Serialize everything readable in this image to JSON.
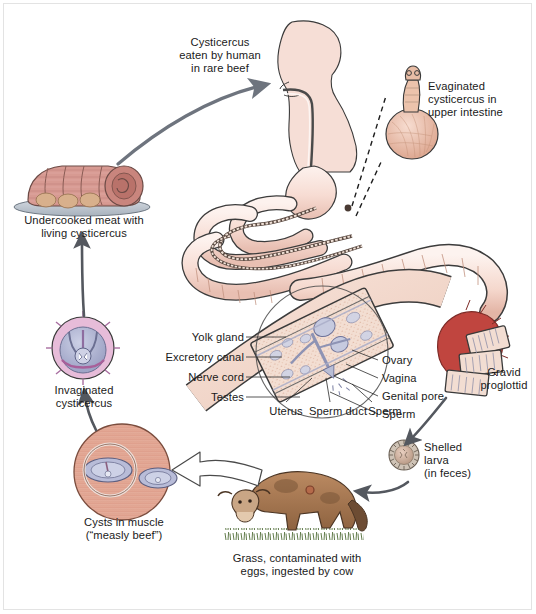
{
  "figure": {
    "background": "#ffffff",
    "border_color": "#e3e3e3"
  },
  "palette": {
    "flesh": "#f6ddd5",
    "flesh_dark": "#e9bfb2",
    "meat_pink": "#d79a92",
    "cyst_purple": "#b9bbd8",
    "cyst_pink": "#e7bcd9",
    "scolex_red": "#c0453f",
    "cow_brown": "#a97a55",
    "grass_green": "#4e6b34",
    "arrow_gray": "#6e747e",
    "arrow_dark": "#54585f",
    "leader_line": "#2b2b2b",
    "text": "#1a1a1a"
  },
  "labels": {
    "eaten_by_human": "Cysticercus\neaten by human\nin rare beef",
    "evaginated": "Evaginated\ncysticercus in\nupper intestine",
    "undercooked_meat": "Undercooked meat with\nliving cysticercus",
    "invaginated": "Invaginated\ncysticercus",
    "gravid_proglottid": "Gravid\nproglottid",
    "shelled_larva": "Shelled\nlarva\n(in feces)",
    "grass_ingested": "Grass, contaminated with\neggs, ingested by cow",
    "cysts_in_muscle": "Cysts in muscle\n(“measly beef”)"
  },
  "anatomy_labels": {
    "left": [
      {
        "text": "Yolk gland"
      },
      {
        "text": "Excretory canal"
      },
      {
        "text": "Nerve cord"
      },
      {
        "text": "Testes"
      }
    ],
    "right": [
      {
        "text": "Ovary"
      },
      {
        "text": "Vagina"
      },
      {
        "text": "Genital pore"
      },
      {
        "text": "Sperm"
      }
    ],
    "bottom": [
      {
        "text": "Uterus"
      },
      {
        "text": "Sperm duct"
      },
      {
        "text": "Sperm"
      }
    ]
  },
  "illustrations": {
    "human": "human-head-and-digestive-tract",
    "evaginated_cysticercus": "scolex-with-bladder",
    "roast_beef": "sliced-roast-on-platter",
    "invaginated_cysticercus": "round-cyst-cross-section",
    "tapeworm": "segmented-tapeworm-in-intestine",
    "proglottid_detail": "magnified-proglottid-reproductive-organs",
    "gravid_segments": "detaching-gravid-proglottids",
    "egg": "shelled-larva-egg",
    "cow": "grazing-cow-on-grass",
    "muscle": "muscle-tissue-with-cysts"
  }
}
